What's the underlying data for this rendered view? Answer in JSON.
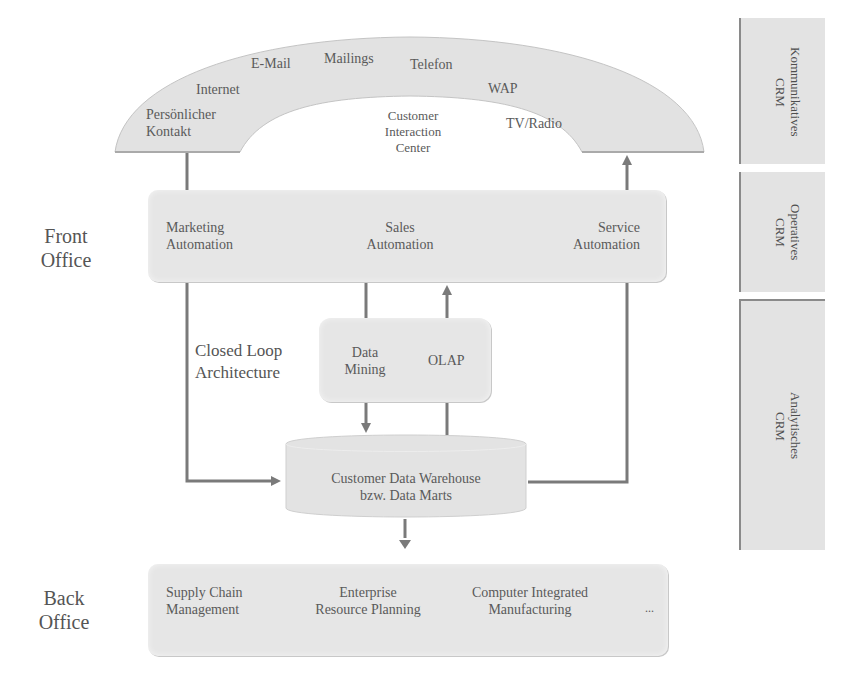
{
  "arc": {
    "channels": [
      {
        "label": "Persönlicher\nKontakt"
      },
      {
        "label": "Internet"
      },
      {
        "label": "E-Mail"
      },
      {
        "label": "Mailings"
      },
      {
        "label": "Telefon"
      },
      {
        "label": "WAP"
      },
      {
        "label": "TV/Radio"
      }
    ],
    "center_label": [
      "Customer",
      "Interaction",
      "Center"
    ]
  },
  "left_labels": {
    "front_office": [
      "Front",
      "Office"
    ],
    "closed_loop": [
      "Closed Loop",
      "Architecture"
    ],
    "back_office": [
      "Back",
      "Office"
    ]
  },
  "front_office_box": {
    "items": [
      {
        "line1": "Marketing",
        "line2": "Automation"
      },
      {
        "line1": "Sales",
        "line2": "Automation"
      },
      {
        "line1": "Service",
        "line2": "Automation"
      }
    ]
  },
  "analysis_box": {
    "data_mining": [
      "Data",
      "Mining"
    ],
    "olap": "OLAP"
  },
  "warehouse": {
    "line1": "Customer Data Warehouse",
    "line2": "bzw. Data Marts"
  },
  "back_office_box": {
    "items": [
      {
        "line1": "Supply Chain",
        "line2": "Management"
      },
      {
        "line1": "Enterprise",
        "line2": "Resource Planning"
      },
      {
        "line1": "Computer Integrated",
        "line2": "Manufacturing"
      }
    ],
    "ellipsis": "..."
  },
  "side_bars": [
    {
      "line1": "Kommunikatives",
      "line2": "CRM"
    },
    {
      "line1": "Operatives",
      "line2": "CRM"
    },
    {
      "line1": "Analytisches",
      "line2": "CRM"
    }
  ],
  "colors": {
    "box_fill": "#e6e6e6",
    "arrow": "#7a7a7a",
    "text": "#555555"
  }
}
